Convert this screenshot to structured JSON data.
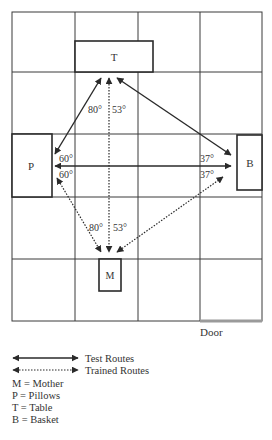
{
  "diagram": {
    "objects": {
      "table": {
        "letter": "T"
      },
      "pillows": {
        "letter": "P"
      },
      "basket": {
        "letter": "B"
      },
      "mother": {
        "letter": "M"
      }
    },
    "angles": {
      "top_left": "80°",
      "top_right": "53°",
      "left_top": "60°",
      "left_bottom": "60°",
      "right_top": "37°",
      "right_bottom": "37°",
      "bottom_left": "80°",
      "bottom_right": "53°"
    },
    "door_label": "Door",
    "routes": {
      "test": [
        "P-T",
        "T-B",
        "P-B"
      ],
      "trained": [
        "M-T",
        "M-P",
        "M-B"
      ]
    }
  },
  "legend": {
    "test_routes": "Test Routes",
    "trained_routes": "Trained Routes",
    "keys": [
      "M = Mother",
      "P = Pillows",
      "T = Table",
      "B = Basket"
    ]
  },
  "colors": {
    "line": "#2a2a2a",
    "grid": "#3a3a3a",
    "door": "#9a9a9a"
  }
}
